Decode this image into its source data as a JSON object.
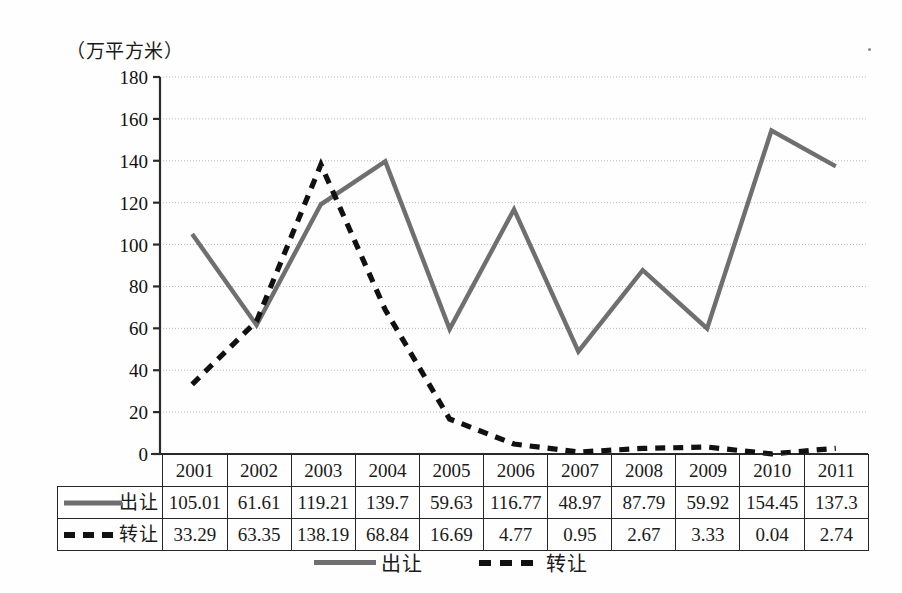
{
  "chart_data": {
    "type": "line",
    "title": "",
    "subtitle": "",
    "xlabel": "",
    "ylabel": "（万平方米）",
    "unit_caption": "（万平方米）",
    "categories": [
      "2001",
      "2002",
      "2003",
      "2004",
      "2005",
      "2006",
      "2007",
      "2008",
      "2009",
      "2010",
      "2011"
    ],
    "series": [
      {
        "name": "出让",
        "style": "solid",
        "color": "#6f6f6f",
        "values": [
          105.01,
          61.61,
          119.21,
          139.7,
          59.63,
          116.77,
          48.97,
          87.79,
          59.92,
          154.45,
          137.3
        ]
      },
      {
        "name": "转让",
        "style": "dashed",
        "color": "#111111",
        "values": [
          33.29,
          63.35,
          138.19,
          68.84,
          16.69,
          4.77,
          0.95,
          2.67,
          3.33,
          0.04,
          2.74
        ]
      }
    ],
    "ylim": [
      0,
      180
    ],
    "ytick_step": 20,
    "yticks": [
      0,
      20,
      40,
      60,
      80,
      100,
      120,
      140,
      160,
      180
    ],
    "ytick_labels": [
      "0",
      "20",
      "40",
      "60",
      "80",
      "100",
      "120",
      "140",
      "160",
      "180"
    ],
    "grid": true,
    "grid_style": "dotted-horizontal",
    "legend_position": "bottom-center"
  },
  "table": {
    "corner_label": "",
    "header_row": [
      "2001",
      "2002",
      "2003",
      "2004",
      "2005",
      "2006",
      "2007",
      "2008",
      "2009",
      "2010",
      "2011"
    ],
    "rows": [
      {
        "label": "出让",
        "marker": "solid-line",
        "values": [
          "105.01",
          "61.61",
          "119.21",
          "139.7",
          "59.63",
          "116.77",
          "48.97",
          "87.79",
          "59.92",
          "154.45",
          "137.3"
        ]
      },
      {
        "label": "转让",
        "marker": "dashed-line",
        "values": [
          "33.29",
          "63.35",
          "138.19",
          "68.84",
          "16.69",
          "4.77",
          "0.95",
          "2.67",
          "3.33",
          "0.04",
          "2.74"
        ]
      }
    ]
  },
  "legend": {
    "items": [
      {
        "label": "出让",
        "marker": "solid-line",
        "color": "#6f6f6f"
      },
      {
        "label": "转让",
        "marker": "dashed-line",
        "color": "#111111"
      }
    ]
  },
  "colors": {
    "solid_series": "#6f6f6f",
    "dashed_series": "#111111",
    "gridline": "#b9b9b9",
    "axis": "#2b2b2b",
    "background": "#fefefe",
    "text": "#101010"
  }
}
